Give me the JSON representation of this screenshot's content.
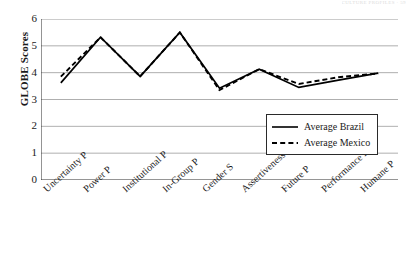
{
  "page": {
    "header_remnant": "CULTURE  PROFILES   ·   59"
  },
  "chart_data": {
    "type": "line",
    "title": "",
    "xlabel": "",
    "ylabel": "GLOBE Scores",
    "ylim": [
      0,
      6
    ],
    "yticks": [
      0,
      1,
      2,
      3,
      4,
      5,
      6
    ],
    "grid": true,
    "legend_position": "lower-right-inside",
    "categories": [
      "Uncertainty P",
      "Power P",
      "Institutional P",
      "In-Group P",
      "Gender S",
      "Assertiveness P",
      "Future P",
      "Performance P",
      "Humane P"
    ],
    "series": [
      {
        "name": "Average Brazil",
        "style": "solid",
        "color": "#000000",
        "values": [
          3.62,
          5.32,
          3.86,
          5.5,
          3.42,
          4.13,
          3.45,
          3.72,
          3.98
        ]
      },
      {
        "name": "Average Mexico",
        "style": "dashed",
        "color": "#000000",
        "values": [
          3.85,
          5.32,
          3.86,
          5.5,
          3.35,
          4.13,
          3.58,
          3.83,
          3.97
        ]
      }
    ]
  },
  "axis": {
    "y_tick_labels": [
      "6",
      "5",
      "4",
      "3",
      "2",
      "1",
      "0"
    ]
  },
  "legend": {
    "items": [
      {
        "label": "Average Brazil",
        "style": "solid"
      },
      {
        "label": "Average Mexico",
        "style": "dashed"
      }
    ]
  }
}
